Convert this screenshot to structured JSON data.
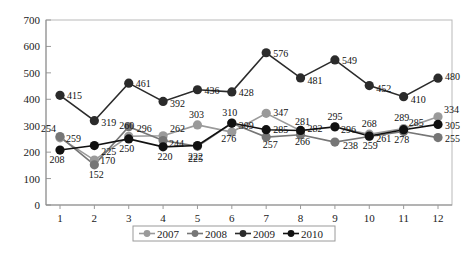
{
  "chart_data": {
    "type": "line",
    "title": "",
    "subtitle": "",
    "xlabel": "",
    "ylabel": "",
    "categories": [
      "1",
      "2",
      "3",
      "4",
      "5",
      "6",
      "7",
      "8",
      "9",
      "10",
      "11",
      "12"
    ],
    "xlim": [
      1,
      12
    ],
    "ylim": [
      0,
      700
    ],
    "y_ticks": [
      0,
      100,
      200,
      300,
      400,
      500,
      600,
      700
    ],
    "y_tick_labels": [
      "0",
      "100",
      "200",
      "300",
      "400",
      "500",
      "600",
      "700"
    ],
    "x_tick_labels": [
      "1",
      "2",
      "3",
      "4",
      "5",
      "6",
      "7",
      "8",
      "9",
      "10",
      "11",
      "12"
    ],
    "grid": false,
    "legend_position": "bottom",
    "show_data_labels": true,
    "marker": "circle",
    "series": [
      {
        "name": "2007",
        "color": "#9a9a9a",
        "values": [
          254,
          170,
          260,
          262,
          303,
          276,
          347,
          281,
          295,
          268,
          289,
          334
        ],
        "labels": [
          "254",
          "170",
          "260",
          "262",
          "303",
          "276",
          "347",
          "281",
          "295",
          "268",
          "289",
          "334"
        ]
      },
      {
        "name": "2008",
        "color": "#767676",
        "values": [
          259,
          152,
          296,
          244,
          222,
          309,
          257,
          266,
          238,
          259,
          278,
          255
        ],
        "labels": [
          "259",
          "152",
          "296",
          "244",
          "222",
          "309",
          "257",
          "266",
          "238",
          "259",
          "278",
          "255"
        ]
      },
      {
        "name": "2009",
        "color": "#2b2b2b",
        "values": [
          415,
          319,
          461,
          392,
          436,
          428,
          576,
          481,
          549,
          452,
          410,
          480
        ],
        "labels": [
          "415",
          "319",
          "461",
          "392",
          "436",
          "428",
          "576",
          "481",
          "549",
          "452",
          "410",
          "480"
        ]
      },
      {
        "name": "2010",
        "color": "#111111",
        "values": [
          208,
          225,
          250,
          220,
          225,
          310,
          285,
          282,
          296,
          261,
          285,
          305
        ],
        "labels": [
          "208",
          "225",
          "250",
          "220",
          "225",
          "310",
          "285",
          "282",
          "296",
          "261",
          "285",
          "305"
        ]
      }
    ]
  },
  "legend": {
    "items": [
      {
        "label": "2007",
        "color": "#9a9a9a"
      },
      {
        "label": "2008",
        "color": "#767676"
      },
      {
        "label": "2009",
        "color": "#2b2b2b"
      },
      {
        "label": "2010",
        "color": "#111111"
      }
    ]
  },
  "label_offsets": {
    "2007": [
      {
        "dx": -4,
        "dy": -6,
        "anchor": "end"
      },
      {
        "dx": 6,
        "dy": 4,
        "anchor": "start"
      },
      {
        "dx": -2,
        "dy": -7,
        "anchor": "middle"
      },
      {
        "dx": 7,
        "dy": -4,
        "anchor": "start"
      },
      {
        "dx": -1,
        "dy": -7,
        "anchor": "middle"
      },
      {
        "dx": -3,
        "dy": 10,
        "anchor": "middle"
      },
      {
        "dx": 7,
        "dy": 3,
        "anchor": "start"
      },
      {
        "dx": 2,
        "dy": -6,
        "anchor": "middle"
      },
      {
        "dx": 0,
        "dy": -7,
        "anchor": "middle"
      },
      {
        "dx": 0,
        "dy": -7,
        "anchor": "middle"
      },
      {
        "dx": -2,
        "dy": -8,
        "anchor": "middle"
      },
      {
        "dx": 6,
        "dy": -4,
        "anchor": "start"
      }
    ],
    "2008": [
      {
        "dx": 6,
        "dy": 5,
        "anchor": "start"
      },
      {
        "dx": 2,
        "dy": 13,
        "anchor": "middle"
      },
      {
        "dx": 8,
        "dy": 5,
        "anchor": "start"
      },
      {
        "dx": 6,
        "dy": 6,
        "anchor": "start"
      },
      {
        "dx": -2,
        "dy": 14,
        "anchor": "middle"
      },
      {
        "dx": 7,
        "dy": 6,
        "anchor": "start"
      },
      {
        "dx": 4,
        "dy": 11,
        "anchor": "middle"
      },
      {
        "dx": 2,
        "dy": 10,
        "anchor": "middle"
      },
      {
        "dx": 8,
        "dy": 7,
        "anchor": "start"
      },
      {
        "dx": 1,
        "dy": 12,
        "anchor": "middle"
      },
      {
        "dx": -2,
        "dy": 11,
        "anchor": "middle"
      },
      {
        "dx": 7,
        "dy": 4,
        "anchor": "start"
      }
    ],
    "2009": [
      {
        "dx": 7,
        "dy": 4,
        "anchor": "start"
      },
      {
        "dx": 7,
        "dy": 5,
        "anchor": "start"
      },
      {
        "dx": 7,
        "dy": 4,
        "anchor": "start"
      },
      {
        "dx": 7,
        "dy": 6,
        "anchor": "start"
      },
      {
        "dx": 7,
        "dy": 4,
        "anchor": "start"
      },
      {
        "dx": 7,
        "dy": 4,
        "anchor": "start"
      },
      {
        "dx": 7,
        "dy": 4,
        "anchor": "start"
      },
      {
        "dx": 7,
        "dy": 6,
        "anchor": "start"
      },
      {
        "dx": 7,
        "dy": 4,
        "anchor": "start"
      },
      {
        "dx": 7,
        "dy": 6,
        "anchor": "start"
      },
      {
        "dx": 7,
        "dy": 6,
        "anchor": "start"
      },
      {
        "dx": 7,
        "dy": 2,
        "anchor": "start"
      }
    ],
    "2010": [
      {
        "dx": -3,
        "dy": 13,
        "anchor": "middle"
      },
      {
        "dx": 7,
        "dy": 9,
        "anchor": "start"
      },
      {
        "dx": -2,
        "dy": 13,
        "anchor": "middle"
      },
      {
        "dx": 2,
        "dy": 13,
        "anchor": "middle"
      },
      {
        "dx": -2,
        "dy": 16,
        "anchor": "middle"
      },
      {
        "dx": -2,
        "dy": -7,
        "anchor": "middle"
      },
      {
        "dx": 7,
        "dy": 3,
        "anchor": "start"
      },
      {
        "dx": 7,
        "dy": 2,
        "anchor": "start"
      },
      {
        "dx": 6,
        "dy": 6,
        "anchor": "start"
      },
      {
        "dx": 7,
        "dy": 6,
        "anchor": "start"
      },
      {
        "dx": 5,
        "dy": -4,
        "anchor": "start"
      },
      {
        "dx": 7,
        "dy": 5,
        "anchor": "start"
      }
    ]
  }
}
